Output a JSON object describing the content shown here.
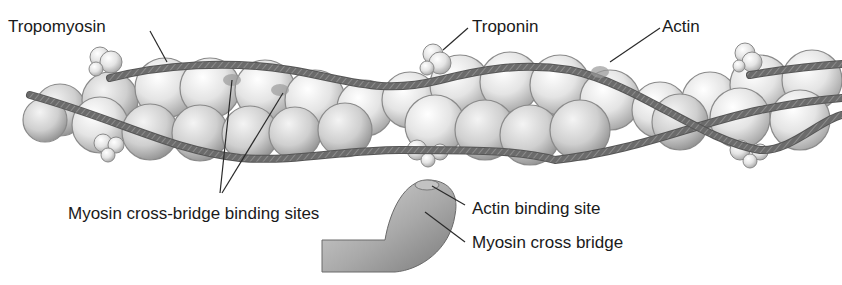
{
  "diagram": {
    "type": "anatomical illustration",
    "labels": {
      "tropomyosin": "Tropomyosin",
      "troponin": "Troponin",
      "actin": "Actin",
      "binding_sites": "Myosin cross-bridge binding sites",
      "actin_binding_site": "Actin binding site",
      "myosin_cross_bridge": "Myosin cross bridge"
    },
    "colors": {
      "background": "#ffffff",
      "actin_sphere_light": "#f2f2f2",
      "actin_sphere_dark": "#b8b8b8",
      "tropomyosin_strand": "#6e6e6e",
      "text": "#1a1a1a",
      "leader_line": "#2a2a2a"
    }
  }
}
